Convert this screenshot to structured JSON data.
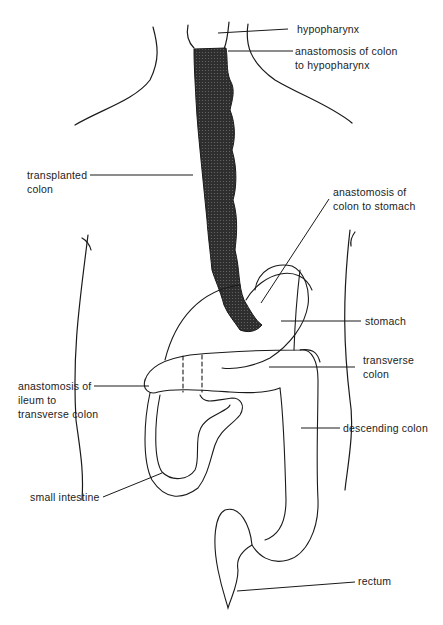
{
  "diagram": {
    "type": "anatomical illustration",
    "labels": {
      "hypopharynx": "hypopharynx",
      "anast_hypo_1": "anastomosis of colon",
      "anast_hypo_2": "to hypopharynx",
      "transplanted_1": "transplanted",
      "transplanted_2": "colon",
      "anast_stomach_1": "anastomosis of",
      "anast_stomach_2": "colon to stomach",
      "stomach": "stomach",
      "transverse_1": "transverse",
      "transverse_2": "colon",
      "anast_ileum_1": "anastomosis of",
      "anast_ileum_2": "ileum to",
      "anast_ileum_3": "transverse colon",
      "descending": "descending colon",
      "small_intestine": "small intestine",
      "rectum": "rectum"
    },
    "colors": {
      "line": "#1a1a1a",
      "fill_transplant": "#3a3a3a",
      "background": "#ffffff"
    }
  }
}
